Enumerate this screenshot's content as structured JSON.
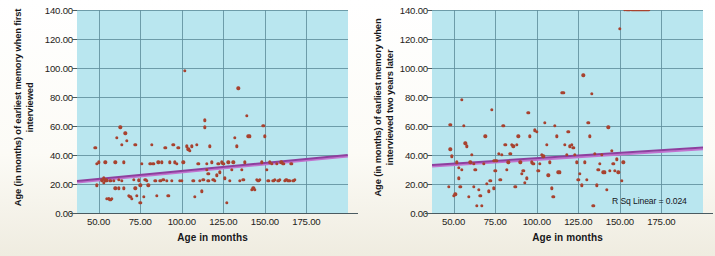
{
  "figure": {
    "background_color": "#fbfaf5",
    "plot_background_color": "#b9e6ef",
    "grid_color": "#5f8e9c",
    "point_color": "#a8422f",
    "regression_color": "#8e3f9e"
  },
  "chart_data": [
    {
      "type": "scatter",
      "panel": "left",
      "title": "",
      "xlabel": "Age in months",
      "ylabel": "Age (in months) of earliest memory when first interviewed",
      "xlim": [
        37,
        200
      ],
      "ylim": [
        0,
        140
      ],
      "xticks": [
        "50.00",
        "75.00",
        "100.00",
        "125.00",
        "150.00",
        "175.00"
      ],
      "xtick_values": [
        50,
        75,
        100,
        125,
        150,
        175
      ],
      "yticks": [
        "0.00",
        "20.00",
        "40.00",
        "60.00",
        "80.00",
        "100.00",
        "120.00",
        "140.00"
      ],
      "ytick_values": [
        0,
        20,
        40,
        60,
        80,
        100,
        120,
        140
      ],
      "grid": true,
      "legend": null,
      "annotation": "",
      "regression": {
        "x0": 37,
        "y0": 22.5,
        "x1": 200,
        "y1": 40.5
      },
      "x": [
        48,
        49,
        49,
        50,
        52,
        52,
        53,
        53,
        54,
        54,
        54,
        55,
        55,
        55,
        56,
        56,
        57,
        57,
        58,
        59,
        60,
        60,
        61,
        62,
        62,
        63,
        64,
        64,
        65,
        65,
        66,
        67,
        68,
        69,
        70,
        71,
        72,
        72,
        73,
        74,
        74,
        75,
        75,
        76,
        77,
        78,
        79,
        80,
        81,
        82,
        83,
        84,
        85,
        86,
        87,
        88,
        89,
        90,
        91,
        92,
        93,
        94,
        95,
        96,
        97,
        98,
        99,
        100,
        101,
        102,
        103,
        104,
        105,
        106,
        107,
        108,
        109,
        110,
        111,
        112,
        113,
        114,
        114,
        115,
        115,
        116,
        116,
        117,
        118,
        119,
        120,
        121,
        122,
        123,
        124,
        125,
        126,
        127,
        128,
        129,
        130,
        131,
        132,
        133,
        134,
        135,
        136,
        137,
        138,
        139,
        140,
        141,
        142,
        143,
        144,
        145,
        146,
        147,
        148,
        149,
        150,
        151,
        152,
        153,
        154,
        155,
        156,
        157,
        158,
        159,
        160,
        161,
        162,
        163,
        164,
        165,
        166,
        167,
        168
      ],
      "y": [
        45,
        34,
        19,
        35,
        23,
        22,
        21,
        24,
        23,
        22,
        35,
        23,
        22,
        10,
        10,
        10,
        9,
        22,
        10,
        22,
        17,
        35,
        52,
        17,
        23,
        59,
        47,
        22,
        35,
        17,
        55,
        50,
        12,
        11,
        10,
        23,
        17,
        47,
        12,
        22,
        23,
        19,
        7,
        34,
        11,
        23,
        22,
        19,
        34,
        47,
        34,
        22,
        12,
        35,
        22,
        35,
        23,
        45,
        22,
        12,
        35,
        22,
        47,
        35,
        34,
        45,
        22,
        22,
        35,
        98,
        46,
        44,
        43,
        46,
        22,
        11,
        47,
        34,
        22,
        15,
        23,
        59,
        64,
        34,
        30,
        22,
        27,
        46,
        35,
        23,
        22,
        26,
        34,
        28,
        35,
        34,
        24,
        7,
        35,
        22,
        30,
        35,
        52,
        46,
        86,
        22,
        30,
        23,
        35,
        67,
        53,
        53,
        16,
        17,
        16,
        23,
        22,
        23,
        35,
        60,
        53,
        30,
        22,
        35,
        34,
        22,
        23,
        34,
        22,
        23,
        35,
        34,
        22,
        23,
        22,
        22,
        34,
        22,
        23
      ]
    },
    {
      "type": "scatter",
      "panel": "right",
      "title": "",
      "xlabel": "Age in months",
      "ylabel": "Age (in months) of earliest memory when interviewed two years later",
      "xlim": [
        37,
        200
      ],
      "ylim": [
        0,
        140
      ],
      "xticks": [
        "50.00",
        "75.00",
        "100.00",
        "125.00",
        "150.00",
        "175.00"
      ],
      "xtick_values": [
        50,
        75,
        100,
        125,
        150,
        175
      ],
      "yticks": [
        "0.00",
        "20.00",
        "40.00",
        "60.00",
        "80.00",
        "100.00",
        "120.00",
        "140.00"
      ],
      "ytick_values": [
        0,
        20,
        40,
        60,
        80,
        100,
        120,
        140
      ],
      "grid": true,
      "legend": null,
      "annotation": "R Sq Linear = 0.024",
      "regression": {
        "x0": 37,
        "y0": 33.5,
        "x1": 200,
        "y1": 45.5
      },
      "x": [
        47,
        48,
        48,
        49,
        50,
        51,
        52,
        53,
        53,
        54,
        55,
        55,
        56,
        57,
        58,
        59,
        60,
        61,
        62,
        62,
        63,
        64,
        65,
        66,
        67,
        68,
        69,
        70,
        71,
        72,
        73,
        74,
        74,
        75,
        75,
        76,
        77,
        78,
        79,
        80,
        81,
        82,
        83,
        84,
        85,
        86,
        87,
        88,
        89,
        90,
        91,
        92,
        93,
        94,
        95,
        96,
        97,
        98,
        99,
        100,
        101,
        102,
        103,
        104,
        105,
        106,
        107,
        108,
        109,
        110,
        111,
        112,
        113,
        114,
        115,
        116,
        117,
        118,
        119,
        120,
        121,
        122,
        123,
        124,
        125,
        126,
        127,
        128,
        129,
        130,
        131,
        132,
        133,
        134,
        135,
        136,
        137,
        138,
        139,
        140,
        141,
        142,
        143,
        144,
        145,
        146,
        147,
        148,
        149,
        150,
        151,
        152,
        153,
        154,
        155,
        156,
        157,
        158,
        159,
        160,
        161,
        162,
        163,
        164,
        165,
        166,
        167
      ],
      "y": [
        18,
        61,
        44,
        39,
        12,
        13,
        35,
        31,
        24,
        18,
        78,
        30,
        60,
        48,
        46,
        11,
        35,
        40,
        18,
        34,
        30,
        5,
        16,
        12,
        5,
        34,
        53,
        20,
        15,
        22,
        71,
        36,
        17,
        36,
        29,
        36,
        41,
        23,
        40,
        60,
        47,
        30,
        35,
        41,
        47,
        46,
        18,
        47,
        53,
        35,
        27,
        29,
        21,
        24,
        69,
        53,
        35,
        34,
        57,
        56,
        29,
        34,
        40,
        39,
        62,
        47,
        26,
        35,
        17,
        11,
        60,
        53,
        28,
        28,
        83,
        83,
        47,
        40,
        56,
        46,
        47,
        45,
        40,
        35,
        23,
        27,
        19,
        95,
        35,
        23,
        62,
        53,
        82,
        5,
        41,
        19,
        30,
        34,
        40,
        28,
        28,
        16,
        59,
        29,
        43,
        34,
        29,
        37,
        28,
        127,
        22,
        35
      ]
    }
  ]
}
